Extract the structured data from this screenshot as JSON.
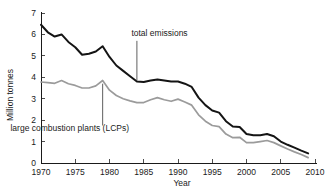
{
  "chart_data": {
    "type": "line",
    "title": "",
    "xlabel": "Year",
    "ylabel": "Million tonnes",
    "xlim": [
      1970,
      2010
    ],
    "ylim": [
      0,
      7
    ],
    "xticks": [
      1970,
      1975,
      1980,
      1985,
      1990,
      1995,
      2000,
      2005,
      2010
    ],
    "yticks": [
      0,
      1,
      2,
      3,
      4,
      5,
      6,
      7
    ],
    "grid": false,
    "legend": "annotated-inline",
    "x": [
      1970,
      1971,
      1972,
      1973,
      1974,
      1975,
      1976,
      1977,
      1978,
      1979,
      1980,
      1981,
      1982,
      1983,
      1984,
      1985,
      1986,
      1987,
      1988,
      1989,
      1990,
      1991,
      1992,
      1993,
      1994,
      1995,
      1996,
      1997,
      1998,
      1999,
      2000,
      2001,
      2002,
      2003,
      2004,
      2005,
      2006,
      2007,
      2008,
      2009
    ],
    "series": [
      {
        "name": "total emissions",
        "color": "#141414",
        "values": [
          6.45,
          6.1,
          5.9,
          6.0,
          5.65,
          5.4,
          5.05,
          5.1,
          5.2,
          5.45,
          4.95,
          4.55,
          4.3,
          4.05,
          3.8,
          3.78,
          3.85,
          3.9,
          3.85,
          3.8,
          3.8,
          3.7,
          3.55,
          3.05,
          2.7,
          2.45,
          2.35,
          1.95,
          1.7,
          1.68,
          1.35,
          1.3,
          1.3,
          1.35,
          1.25,
          1.0,
          0.85,
          0.72,
          0.58,
          0.45
        ]
      },
      {
        "name": "large combustion plants (LCPs)",
        "color": "#9b9b9b",
        "values": [
          3.78,
          3.75,
          3.72,
          3.85,
          3.7,
          3.62,
          3.5,
          3.5,
          3.6,
          3.85,
          3.4,
          3.15,
          3.0,
          2.9,
          2.82,
          2.82,
          2.95,
          3.05,
          2.95,
          2.88,
          2.98,
          2.85,
          2.7,
          2.25,
          1.95,
          1.75,
          1.7,
          1.35,
          1.18,
          1.2,
          0.95,
          0.95,
          1.0,
          1.05,
          0.95,
          0.8,
          0.65,
          0.52,
          0.4,
          0.25
        ]
      }
    ],
    "annotations": [
      {
        "id": "total-emissions",
        "text": "total emissions",
        "text_x": 1983.2,
        "text_y": 5.95,
        "leader_from_x": 1984.0,
        "leader_from_y": 5.7,
        "leader_to_x": 1984.0,
        "leader_to_y": 3.85
      },
      {
        "id": "lcp",
        "text": "large combustion plants (LCPs)",
        "text_x": 1974.2,
        "text_y": 1.5,
        "leader_from_x": 1979.0,
        "leader_from_y": 1.75,
        "leader_to_x": 1979.0,
        "leader_to_y": 3.7
      }
    ]
  },
  "axis": {
    "ylabel": "Million tonnes",
    "xlabel": "Year",
    "xtick_labels": [
      "1970",
      "1975",
      "1980",
      "1985",
      "1990",
      "1995",
      "2000",
      "2005",
      "2010"
    ],
    "ytick_labels": [
      "0",
      "1",
      "2",
      "3",
      "4",
      "5",
      "6",
      "7"
    ]
  },
  "annotations": {
    "total_emissions_label": "total emissions",
    "lcp_label": "large combustion plants (LCPs)"
  },
  "colors": {
    "total_emissions": "#141414",
    "lcp": "#9b9b9b",
    "axis": "#1a1a1a",
    "background": "#ffffff"
  }
}
